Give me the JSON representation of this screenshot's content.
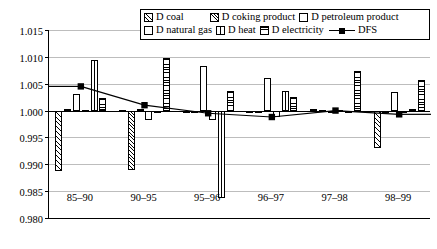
{
  "legend": {
    "rows": [
      [
        {
          "key": "coal",
          "label": "D coal",
          "swatch": "hatch-diagonal"
        },
        {
          "key": "coking",
          "label": "D coking product",
          "swatch": "hatch-diagonal-dense"
        },
        {
          "key": "petroleum",
          "label": "D petroleum product",
          "swatch": "empty"
        }
      ],
      [
        {
          "key": "natural_gas",
          "label": "D natural gas",
          "swatch": "empty"
        },
        {
          "key": "heat",
          "label": "D heat",
          "swatch": "vertical-divided"
        },
        {
          "key": "electricity",
          "label": "D electricity",
          "swatch": "horizontal-lines"
        },
        {
          "key": "dfs",
          "label": "DFS",
          "swatch": "line-marker"
        }
      ]
    ]
  },
  "chart_data": {
    "type": "bar",
    "title": "",
    "xlabel": "",
    "ylabel": "",
    "ylim": [
      0.98,
      1.015
    ],
    "baseline": 1.0,
    "grid": true,
    "legend_position": "top-right",
    "categories": [
      "85–90",
      "90–95",
      "95–96",
      "96–97",
      "97–98",
      "98–99"
    ],
    "yticks": [
      "0.980",
      "0.985",
      "0.990",
      "0.995",
      "1.000",
      "1.005",
      "1.010",
      "1.015"
    ],
    "ytick_values": [
      0.98,
      0.985,
      0.99,
      0.995,
      1.0,
      1.005,
      1.01,
      1.015
    ],
    "series": [
      {
        "name": "D coal",
        "pattern": "hatch-diagonal",
        "values": [
          0.9888,
          1.0001,
          0.9996,
          0.9999,
          1.0002,
          0.993
        ]
      },
      {
        "name": "D coking product",
        "pattern": "hatch-diagonal-dense",
        "values": [
          1.0003,
          0.989,
          0.9999,
          0.9999,
          1.0001,
          1.0
        ]
      },
      {
        "name": "D petroleum product",
        "pattern": "empty",
        "values": [
          1.003,
          1.0002,
          1.0083,
          1.006,
          0.9999,
          1.0034
        ]
      },
      {
        "name": "D natural gas",
        "pattern": "empty",
        "values": [
          1.0001,
          0.9983,
          0.9983,
          0.9988,
          1.0001,
          1.0
        ]
      },
      {
        "name": "D heat",
        "pattern": "vertical-divided",
        "values": [
          1.0095,
          0.9996,
          0.9838,
          1.0036,
          1.0,
          1.0002
        ]
      },
      {
        "name": "D electricity",
        "pattern": "horizontal-lines",
        "values": [
          1.0023,
          1.0097,
          1.0036,
          1.0025,
          1.0073,
          1.0057
        ]
      }
    ],
    "line_series": {
      "name": "DFS",
      "marker": "filled-square",
      "values": [
        1.0045,
        1.001,
        0.9995,
        0.9988,
        1.0,
        0.9993
      ]
    }
  }
}
